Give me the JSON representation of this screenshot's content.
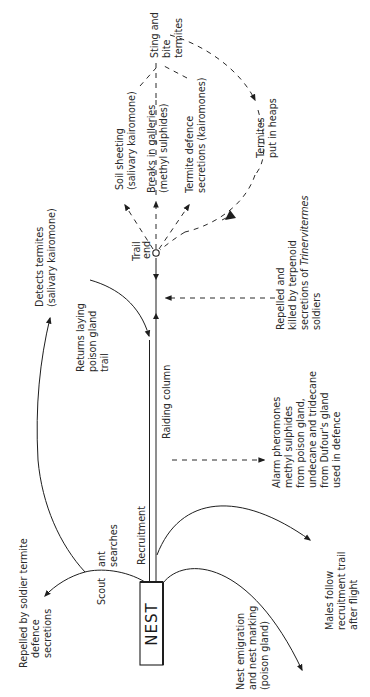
{
  "diagram": {
    "nest_label": "NEST",
    "trail": {
      "recruitment_label": "Recruitment",
      "raiding_column_label": "Raiding column",
      "trail_end_label": [
        "Trail",
        "end"
      ]
    },
    "labels": {
      "sting_and_bite": [
        "Sting and",
        "bite",
        "termites"
      ],
      "soil_sheeting": [
        "Soil sheeting",
        "(salivary kairomone)"
      ],
      "breaks_in_galleries": [
        "Breaks in galleries",
        "(methyl sulphides)"
      ],
      "termite_defence": [
        "Termite defence",
        "secretions (kairomones)"
      ],
      "termites_put_in_heaps": [
        "Termites",
        "put in heaps"
      ],
      "detects_termites": [
        "Detects termites",
        "(salivary kairomone)"
      ],
      "returns_laying": [
        "Returns laying",
        "poison gland",
        "trail"
      ],
      "repelled_and_killed": [
        "Repelled and",
        "killed by terpenoid",
        "secretions of ",
        "Trinervitermes",
        "soldiers"
      ],
      "alarm_pheromones": [
        "Alarm pheromones",
        "methyl sulphides",
        "from poison gland,",
        "undecane and tridecane",
        "from Dufour's gland",
        "used in defence"
      ],
      "scout_searches": [
        "Scout",
        "ant",
        "searches"
      ],
      "repelled_by_soldier": [
        "Repelled by soldier termite",
        "defence",
        "secretions"
      ],
      "nest_emigration": [
        "Nest emigration",
        "and nest marking",
        "(poison gland)"
      ],
      "males_follow": [
        "Males follow",
        "recruitment trail",
        "after flight"
      ]
    },
    "colors": {
      "ink": "#1e1e1e",
      "background": "#ffffff"
    }
  }
}
